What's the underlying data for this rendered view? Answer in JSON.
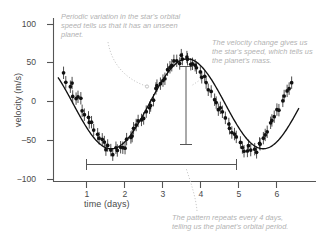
{
  "chart_data": {
    "type": "scatter",
    "title": "",
    "xlabel": "time (days)",
    "ylabel": "velocity (m/s)",
    "xlim": [
      0.25,
      6.6
    ],
    "ylim": [
      -110,
      112
    ],
    "xticks": [
      "1",
      "2",
      "3",
      "4",
      "5",
      "6"
    ],
    "xtick_values": [
      1,
      2,
      3,
      4,
      5,
      6
    ],
    "yticks": [
      "100",
      "50",
      "0",
      "‒50",
      "−100"
    ],
    "ytick_values": [
      100,
      50,
      0,
      -50,
      -100
    ],
    "grid": false,
    "legend": null,
    "series": [
      {
        "name": "radial velocity fit",
        "type": "line",
        "model": "sinusoid",
        "amplitude": 58,
        "period": 4.0,
        "phase_peak_day": 3.65,
        "offset": -3
      },
      {
        "name": "measured radial velocity",
        "type": "scatter_with_errorbars",
        "errorbar": 8,
        "x": [
          0.42,
          0.48,
          0.55,
          0.6,
          0.66,
          0.72,
          0.78,
          0.84,
          0.9,
          0.97,
          1.03,
          1.09,
          1.15,
          1.21,
          1.27,
          1.33,
          1.4,
          1.46,
          1.52,
          1.58,
          1.64,
          1.7,
          1.77,
          1.83,
          1.89,
          1.95,
          2.01,
          2.07,
          2.14,
          2.2,
          2.26,
          2.32,
          2.38,
          2.44,
          2.51,
          2.57,
          2.63,
          2.69,
          2.75,
          2.81,
          2.88,
          2.94,
          3.0,
          3.06,
          3.12,
          3.18,
          3.25,
          3.31,
          3.37,
          3.43,
          3.49,
          3.55,
          3.62,
          3.68,
          3.74,
          3.8,
          3.86,
          3.92,
          3.99,
          4.05,
          4.11,
          4.17,
          4.23,
          4.29,
          4.36,
          4.42,
          4.48,
          4.54,
          4.6,
          4.66,
          4.73,
          4.79,
          4.85,
          4.91,
          4.97,
          5.03,
          5.1,
          5.16,
          5.22,
          5.28,
          5.34,
          5.4,
          5.47,
          5.53,
          5.59,
          5.65,
          5.71,
          5.77,
          5.84,
          5.9,
          5.96,
          6.02,
          6.08,
          6.14,
          6.21,
          6.27,
          6.33,
          6.39
        ],
        "y": [
          33,
          28,
          22,
          19,
          12,
          6,
          2,
          -1,
          -7,
          -13,
          -17,
          -24,
          -28,
          -34,
          -38,
          -44,
          -49,
          -53,
          -57,
          -61,
          -63,
          -65,
          -64,
          -62,
          -64,
          -60,
          -57,
          -53,
          -50,
          -45,
          -40,
          -35,
          -29,
          -24,
          -18,
          -12,
          -6,
          0,
          6,
          12,
          18,
          24,
          29,
          34,
          39,
          43,
          47,
          50,
          52,
          54,
          55,
          55,
          54,
          55,
          53,
          51,
          48,
          44,
          40,
          35,
          30,
          24,
          18,
          12,
          6,
          0,
          -6,
          -12,
          -18,
          -24,
          -30,
          -35,
          -40,
          -45,
          -49,
          -53,
          -56,
          -59,
          -61,
          -62,
          -63,
          -62,
          -61,
          -58,
          -55,
          -50,
          -45,
          -39,
          -33,
          -26,
          -20,
          -13,
          -7,
          0,
          7,
          14,
          21,
          28
        ]
      }
    ],
    "annotations": [
      {
        "id": "periodic-variation",
        "text": "Periodic variation in the star's orbital speed tells us that it has an unseen planet.",
        "leader": "curved-dotted-to-curve"
      },
      {
        "id": "velocity-change",
        "text": "The velocity change gives us the star's speed, which tells us the planet's mass.",
        "leader": "dotted-to-amplitude-bar"
      },
      {
        "id": "orbital-period",
        "text": "The pattern repeats every 4 days, telling us the planet's orbital period.",
        "leader": "dotted-to-period-bar"
      }
    ],
    "measurement_bars": [
      {
        "id": "amplitude-bar",
        "orientation": "vertical",
        "x_day": 3.65,
        "y_from": 55,
        "y_to": -55,
        "meaning": "velocity change (star's speed)"
      },
      {
        "id": "period-bar",
        "orientation": "horizontal",
        "y_value": -83,
        "x_from": 1.6,
        "x_to": 5.62,
        "meaning": "orbital period = 4 days"
      }
    ],
    "colors": {
      "data": "#111111",
      "fit_line": "#111111",
      "axis": "#555555",
      "annotation_text": "#b2b2b2",
      "leader_line": "#c0c0c0",
      "background": "#ffffff"
    }
  },
  "axes": {
    "x_title": "time (days)",
    "y_title": "velocity (m/s)",
    "x_ticks": [
      "1",
      "2",
      "3",
      "4",
      "5",
      "6"
    ],
    "y_ticks": [
      "100",
      "50",
      "0",
      "‒50",
      "−100"
    ]
  },
  "annotations": {
    "periodic": "Periodic variation in the star's orbital speed tells us that it has an unseen planet.",
    "velocity": "The velocity change gives us the star's speed, which tells us the planet's mass.",
    "period": "The pattern repeats every 4 days, telling us the planet's orbital period."
  }
}
